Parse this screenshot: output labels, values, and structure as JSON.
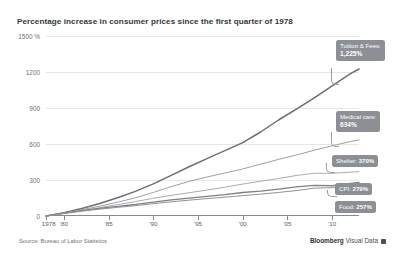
{
  "chart": {
    "title": "Percentage increase in consumer prices since the first quarter of 1978",
    "source_note": "Source: Bureau of Labor Statistics",
    "brand_name": "Bloomberg",
    "brand_suffix": "Visual Data",
    "brand_mark": "square-logo-icon"
  },
  "chart_data": {
    "type": "line",
    "title": "Percentage increase in consumer prices since the first quarter of 1978",
    "xlabel": "",
    "ylabel": "",
    "xlim": [
      1978,
      2013
    ],
    "ylim": [
      0,
      1500
    ],
    "grid": true,
    "legend_position": "right-inline-callouts",
    "ytick_labels": [
      "1500 %",
      "1200",
      "900",
      "600",
      "300",
      "0"
    ],
    "ytick_values": [
      1500,
      1200,
      900,
      600,
      300,
      0
    ],
    "xtick_labels": [
      "1978",
      "'80",
      "'85",
      "'90",
      "'95",
      "'00",
      "'05",
      "'10"
    ],
    "xtick_values": [
      1978,
      1980,
      1985,
      1990,
      1995,
      2000,
      2005,
      2010
    ],
    "x": [
      1978,
      1980,
      1982,
      1984,
      1986,
      1988,
      1990,
      1992,
      1994,
      1996,
      1998,
      2000,
      2002,
      2004,
      2006,
      2008,
      2010,
      2012,
      2013
    ],
    "series": [
      {
        "name": "Tuition & Fees",
        "end_value": 1225,
        "end_label": "1,225%",
        "values": [
          0,
          28,
          62,
          104,
          152,
          205,
          268,
          338,
          410,
          478,
          545,
          612,
          700,
          800,
          890,
          985,
          1085,
          1185,
          1225
        ]
      },
      {
        "name": "Medical care",
        "end_value": 634,
        "end_label": "634%",
        "values": [
          0,
          24,
          52,
          82,
          115,
          152,
          196,
          245,
          288,
          325,
          358,
          392,
          432,
          472,
          508,
          548,
          585,
          620,
          634
        ]
      },
      {
        "name": "Shelter",
        "end_value": 370,
        "end_label": "370%",
        "values": [
          0,
          22,
          46,
          70,
          95,
          120,
          148,
          172,
          194,
          216,
          240,
          266,
          290,
          312,
          338,
          356,
          356,
          365,
          370
        ]
      },
      {
        "name": "CPI",
        "end_value": 279,
        "end_label": "279%",
        "values": [
          0,
          24,
          45,
          64,
          80,
          96,
          116,
          134,
          149,
          164,
          178,
          196,
          208,
          224,
          243,
          256,
          252,
          272,
          279
        ]
      },
      {
        "name": "Food",
        "end_value": 257,
        "end_label": "257%",
        "values": [
          0,
          20,
          40,
          57,
          72,
          86,
          103,
          118,
          132,
          145,
          157,
          170,
          182,
          196,
          212,
          232,
          236,
          250,
          257
        ]
      }
    ],
    "callouts": [
      {
        "name": "Tuition & Fees:",
        "value": "1,225%",
        "style": "stacked"
      },
      {
        "name": "Medical care:",
        "value": "634%",
        "style": "stacked"
      },
      {
        "name": "Shelter:",
        "value": "370%",
        "style": "inline"
      },
      {
        "name": "CPI:",
        "value": "279%",
        "style": "inline"
      },
      {
        "name": "Food:",
        "value": "257%",
        "style": "inline"
      }
    ]
  }
}
